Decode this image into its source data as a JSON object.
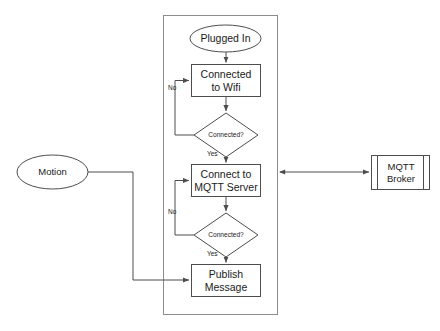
{
  "diagram": {
    "colors": {
      "stroke": "#4d4d4d",
      "container_stroke": "#808080",
      "text": "#1a1a1a",
      "background": "#ffffff",
      "fill": "#ffffff"
    },
    "container": {
      "name": "device-process-container",
      "x": 163,
      "y": 15,
      "width": 115,
      "height": 300
    },
    "nodes": [
      {
        "id": "plugged-in",
        "shape": "ellipse",
        "label": "Plugged In",
        "x": 190,
        "y": 25,
        "width": 71,
        "height": 27
      },
      {
        "id": "connected-to-wifi",
        "shape": "process",
        "label": "Connected\nto Wifi",
        "x": 191,
        "y": 64,
        "width": 70,
        "height": 33
      },
      {
        "id": "wifi-connected-decision",
        "shape": "decision",
        "label": "Connected?",
        "x": 194,
        "y": 113,
        "width": 64,
        "height": 44
      },
      {
        "id": "connect-to-mqtt-server",
        "shape": "process",
        "label": "Connect to\nMQTT Server",
        "x": 191,
        "y": 164,
        "width": 70,
        "height": 33
      },
      {
        "id": "mqtt-connected-decision",
        "shape": "decision",
        "label": "Connected?",
        "x": 194,
        "y": 213,
        "width": 64,
        "height": 44
      },
      {
        "id": "publish-message",
        "shape": "process",
        "label": "Publish\nMessage",
        "x": 191,
        "y": 264,
        "width": 70,
        "height": 33
      },
      {
        "id": "motion",
        "shape": "ellipse",
        "label": "Motion",
        "x": 17,
        "y": 155,
        "width": 71,
        "height": 34
      },
      {
        "id": "mqtt-broker",
        "shape": "predefined-process",
        "label": "MQTT\nBroker",
        "x": 371,
        "y": 155,
        "width": 59,
        "height": 35
      }
    ],
    "edge_labels": [
      {
        "id": "wifi-no",
        "text": "No",
        "x": 168,
        "y": 87
      },
      {
        "id": "wifi-yes",
        "text": "Yes",
        "x": 207,
        "y": 157
      },
      {
        "id": "mqtt-no",
        "text": "No",
        "x": 168,
        "y": 211
      },
      {
        "id": "mqtt-yes",
        "text": "Yes",
        "x": 207,
        "y": 257
      }
    ],
    "edges": [
      {
        "id": "plugged-in-to-wifi",
        "from": "plugged-in",
        "to": "connected-to-wifi",
        "arrow": "end"
      },
      {
        "id": "wifi-to-decision",
        "from": "connected-to-wifi",
        "to": "wifi-connected-decision",
        "arrow": "end"
      },
      {
        "id": "wifi-decision-no-loop",
        "from": "wifi-connected-decision",
        "to": "connected-to-wifi",
        "arrow": "end",
        "label": "No"
      },
      {
        "id": "wifi-decision-yes",
        "from": "wifi-connected-decision",
        "to": "connect-to-mqtt-server",
        "arrow": "end",
        "label": "Yes"
      },
      {
        "id": "mqtt-to-decision",
        "from": "connect-to-mqtt-server",
        "to": "mqtt-connected-decision",
        "arrow": "end"
      },
      {
        "id": "mqtt-decision-no-loop",
        "from": "mqtt-connected-decision",
        "to": "connect-to-mqtt-server",
        "arrow": "end",
        "label": "No"
      },
      {
        "id": "mqtt-decision-yes",
        "from": "mqtt-connected-decision",
        "to": "publish-message",
        "arrow": "end",
        "label": "Yes"
      },
      {
        "id": "motion-to-publish",
        "from": "motion",
        "to": "publish-message",
        "arrow": "end"
      },
      {
        "id": "container-to-broker",
        "from": "device-process-container",
        "to": "mqtt-broker",
        "arrow": "both"
      }
    ]
  }
}
